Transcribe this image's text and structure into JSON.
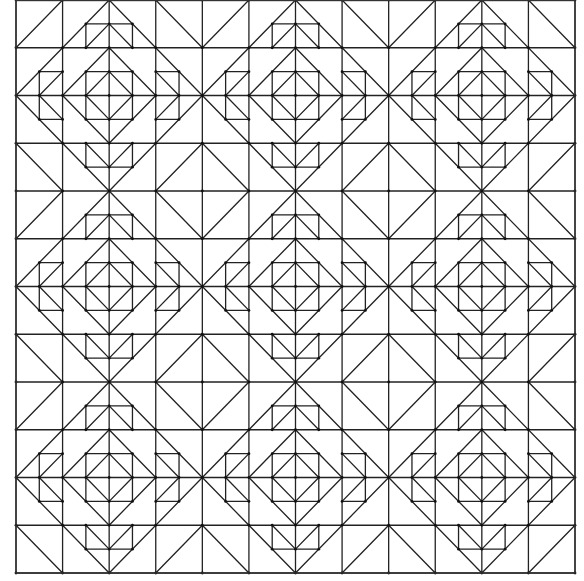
{
  "figure": {
    "title": "",
    "pattern": "3x3 repeating blocks; each block has a central nested square-in-diamond with four flying-geese units around it",
    "blocks_across": 3,
    "blocks_down": 3,
    "units_per_block": 4,
    "line_color": "#222222",
    "background_color": "#ffffff",
    "motifs": [
      "center-square-in-square-diamond",
      "flying-geese-top",
      "flying-geese-bottom",
      "flying-geese-left",
      "flying-geese-right",
      "corner-diamond-with-cross"
    ]
  }
}
